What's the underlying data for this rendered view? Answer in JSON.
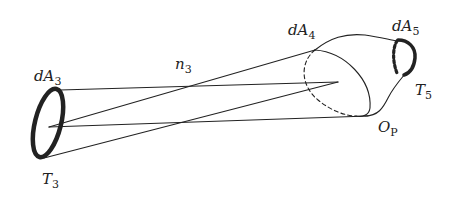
{
  "diagram": {
    "labels": {
      "dA3": {
        "main": "dA",
        "sub": "3"
      },
      "T3": {
        "main": "T",
        "sub": "3"
      },
      "n3": {
        "main": "n",
        "sub": "3"
      },
      "dA4": {
        "main": "dA",
        "sub": "4"
      },
      "dA5": {
        "main": "dA",
        "sub": "5"
      },
      "T5": {
        "main": "T",
        "sub": "5"
      },
      "OP": {
        "main": "O",
        "sub": "P"
      }
    },
    "colors": {
      "stroke": "#222222",
      "background": "#ffffff"
    }
  }
}
